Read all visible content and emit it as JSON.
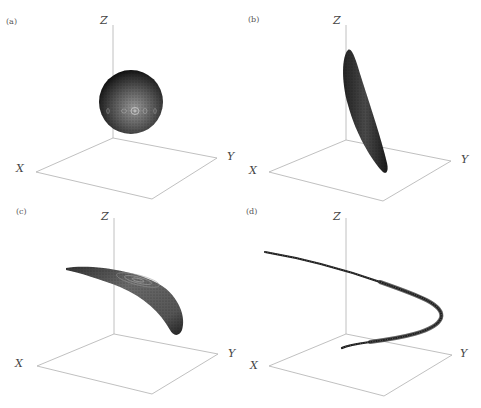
{
  "figure": {
    "panels": [
      {
        "id": "a",
        "label": "(a)",
        "axes": {
          "x": "X",
          "y": "Y",
          "z": "Z"
        },
        "shape": "sphere",
        "description": "Dense point cloud forming a sphere floating above the XY plane"
      },
      {
        "id": "b",
        "label": "(b)",
        "axes": {
          "x": "X",
          "y": "Y",
          "z": "Z"
        },
        "shape": "elongated-ellipsoid",
        "description": "Thin elongated leaf-shaped ellipsoid tilted from near the Z axis down toward the Y side"
      },
      {
        "id": "c",
        "label": "(c)",
        "axes": {
          "x": "X",
          "y": "Y",
          "z": "Z"
        },
        "shape": "curved-banana",
        "description": "Curved banana-shaped surface with concentric contour rings"
      },
      {
        "id": "d",
        "label": "(d)",
        "axes": {
          "x": "X",
          "y": "Y",
          "z": "Z"
        },
        "shape": "parabolic-ribbon",
        "description": "Thin curved ribbon forming a parabola-like arc that turns back toward the origin"
      }
    ]
  },
  "colors": {
    "axis": "#b0b0b0",
    "surface_dark": "#1a1a1a",
    "surface_mid": "#555555",
    "surface_light": "#8a8a8a",
    "text": "#444444"
  }
}
